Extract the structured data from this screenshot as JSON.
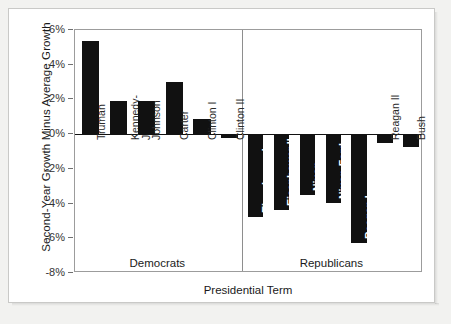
{
  "chart_data": {
    "type": "bar",
    "title": "",
    "xlabel": "Presidential Term",
    "ylabel": "Second-Year Growth Minus Average Growth",
    "ylim": [
      -8,
      6
    ],
    "ytick_labels": [
      "6%",
      "4%",
      "2%",
      "0%",
      "-2%",
      "-4%",
      "-6%",
      "-8%"
    ],
    "ytick_values": [
      6,
      4,
      2,
      0,
      -2,
      -4,
      -6,
      -8
    ],
    "grid": false,
    "legend": "none",
    "units": "percent",
    "bar_color": "#111111",
    "groups": [
      {
        "name": "Democrats",
        "categories": [
          "Truman",
          "Kennedy-Johnson",
          "Johnson",
          "Carter",
          "Clinton I",
          "Clinton II"
        ],
        "values": [
          5.35,
          1.9,
          1.9,
          3.0,
          0.85,
          -0.2
        ]
      },
      {
        "name": "Republicans",
        "categories": [
          "Eisenhower I",
          "Eisenhower II",
          "Nixon",
          "Nixon-Ford",
          "Reagan I",
          "Reagan II",
          "Bush"
        ],
        "values": [
          -4.8,
          -4.35,
          -3.5,
          -3.95,
          -6.3,
          -0.5,
          -0.75
        ]
      }
    ],
    "categories": [
      "Truman",
      "Kennedy-Johnson",
      "Johnson",
      "Carter",
      "Clinton I",
      "Clinton II",
      "Eisenhower I",
      "Eisenhower II",
      "Nixon",
      "Nixon-Ford",
      "Reagan I",
      "Reagan II",
      "Bush"
    ],
    "values": [
      5.35,
      1.9,
      1.9,
      3.0,
      0.85,
      -0.2,
      -4.8,
      -4.35,
      -3.5,
      -3.95,
      -6.3,
      -0.5,
      -0.75
    ]
  }
}
